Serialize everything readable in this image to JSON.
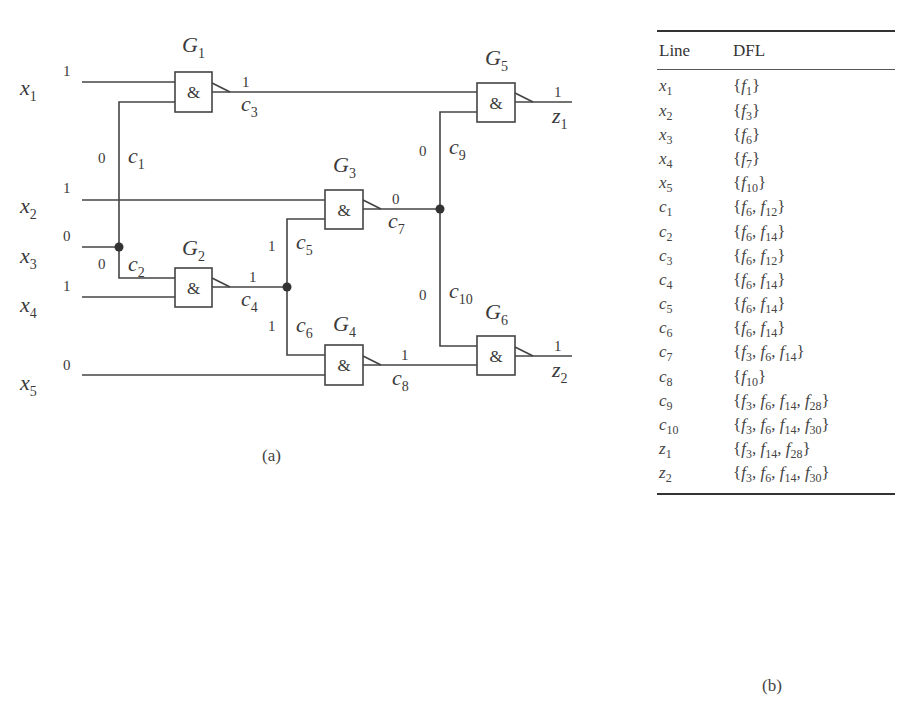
{
  "figure": {
    "circuit_caption": "(a)",
    "table_caption": "(b)"
  },
  "circuit": {
    "inputs": [
      {
        "name": "x",
        "sub": "1",
        "value": "1"
      },
      {
        "name": "x",
        "sub": "2",
        "value": "1"
      },
      {
        "name": "x",
        "sub": "3",
        "value": "0"
      },
      {
        "name": "x",
        "sub": "4",
        "value": "1"
      },
      {
        "name": "x",
        "sub": "5",
        "value": "0"
      }
    ],
    "gates": [
      {
        "name": "G",
        "sub": "1",
        "symbol": "&"
      },
      {
        "name": "G",
        "sub": "2",
        "symbol": "&"
      },
      {
        "name": "G",
        "sub": "3",
        "symbol": "&"
      },
      {
        "name": "G",
        "sub": "4",
        "symbol": "&"
      },
      {
        "name": "G",
        "sub": "5",
        "symbol": "&"
      },
      {
        "name": "G",
        "sub": "6",
        "symbol": "&"
      }
    ],
    "lines": [
      {
        "name": "c",
        "sub": "1",
        "value": "0"
      },
      {
        "name": "c",
        "sub": "2",
        "value": "0"
      },
      {
        "name": "c",
        "sub": "3",
        "value": "1"
      },
      {
        "name": "c",
        "sub": "4",
        "value": "1"
      },
      {
        "name": "c",
        "sub": "5",
        "value": "1"
      },
      {
        "name": "c",
        "sub": "6",
        "value": "1"
      },
      {
        "name": "c",
        "sub": "7",
        "value": "0"
      },
      {
        "name": "c",
        "sub": "8",
        "value": "1"
      },
      {
        "name": "c",
        "sub": "9",
        "value": "0"
      },
      {
        "name": "c",
        "sub": "10",
        "value": "0"
      }
    ],
    "outputs": [
      {
        "name": "z",
        "sub": "1",
        "value": "1"
      },
      {
        "name": "z",
        "sub": "2",
        "value": "1"
      }
    ]
  },
  "table": {
    "headers": {
      "line": "Line",
      "dfl": "DFL"
    },
    "rows": [
      {
        "line": "x",
        "line_sub": "1",
        "dfl": [
          [
            "f",
            "1"
          ]
        ]
      },
      {
        "line": "x",
        "line_sub": "2",
        "dfl": [
          [
            "f",
            "3"
          ]
        ]
      },
      {
        "line": "x",
        "line_sub": "3",
        "dfl": [
          [
            "f",
            "6"
          ]
        ]
      },
      {
        "line": "x",
        "line_sub": "4",
        "dfl": [
          [
            "f",
            "7"
          ]
        ]
      },
      {
        "line": "x",
        "line_sub": "5",
        "dfl": [
          [
            "f",
            "10"
          ]
        ]
      },
      {
        "line": "c",
        "line_sub": "1",
        "dfl": [
          [
            "f",
            "6"
          ],
          [
            "f",
            "12"
          ]
        ]
      },
      {
        "line": "c",
        "line_sub": "2",
        "dfl": [
          [
            "f",
            "6"
          ],
          [
            "f",
            "14"
          ]
        ]
      },
      {
        "line": "c",
        "line_sub": "3",
        "dfl": [
          [
            "f",
            "6"
          ],
          [
            "f",
            "12"
          ]
        ]
      },
      {
        "line": "c",
        "line_sub": "4",
        "dfl": [
          [
            "f",
            "6"
          ],
          [
            "f",
            "14"
          ]
        ]
      },
      {
        "line": "c",
        "line_sub": "5",
        "dfl": [
          [
            "f",
            "6"
          ],
          [
            "f",
            "14"
          ]
        ]
      },
      {
        "line": "c",
        "line_sub": "6",
        "dfl": [
          [
            "f",
            "6"
          ],
          [
            "f",
            "14"
          ]
        ]
      },
      {
        "line": "c",
        "line_sub": "7",
        "dfl": [
          [
            "f",
            "3"
          ],
          [
            "f",
            "6"
          ],
          [
            "f",
            "14"
          ]
        ]
      },
      {
        "line": "c",
        "line_sub": "8",
        "dfl": [
          [
            "f",
            "10"
          ]
        ]
      },
      {
        "line": "c",
        "line_sub": "9",
        "dfl": [
          [
            "f",
            "3"
          ],
          [
            "f",
            "6"
          ],
          [
            "f",
            "14"
          ],
          [
            "f",
            "28"
          ]
        ]
      },
      {
        "line": "c",
        "line_sub": "10",
        "dfl": [
          [
            "f",
            "3"
          ],
          [
            "f",
            "6"
          ],
          [
            "f",
            "14"
          ],
          [
            "f",
            "30"
          ]
        ]
      },
      {
        "line": "z",
        "line_sub": "1",
        "dfl": [
          [
            "f",
            "3"
          ],
          [
            "f",
            "14"
          ],
          [
            "f",
            "28"
          ]
        ]
      },
      {
        "line": "z",
        "line_sub": "2",
        "dfl": [
          [
            "f",
            "3"
          ],
          [
            "f",
            "6"
          ],
          [
            "f",
            "14"
          ],
          [
            "f",
            "30"
          ]
        ]
      }
    ]
  }
}
